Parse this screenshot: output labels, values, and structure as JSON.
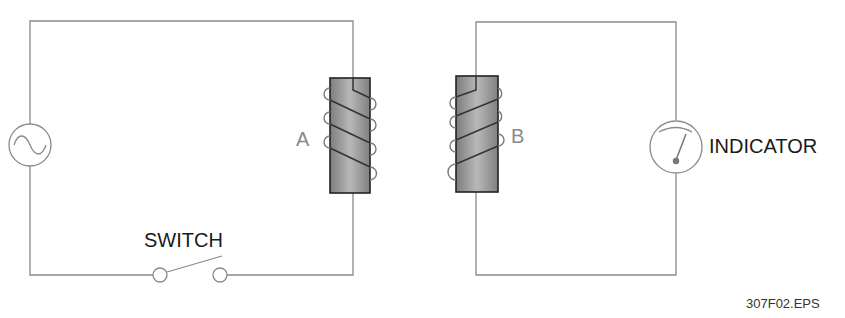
{
  "diagram": {
    "type": "mutual-induction circuit",
    "labels": {
      "coil_a": "A",
      "coil_b": "B",
      "switch": "SWITCH",
      "indicator": "INDICATOR",
      "figure_id": "307F02.EPS"
    },
    "components": [
      {
        "id": "ac-source",
        "kind": "AC source",
        "circuit": "primary"
      },
      {
        "id": "switch",
        "kind": "switch (open)",
        "circuit": "primary"
      },
      {
        "id": "coil-a",
        "kind": "iron-core coil",
        "circuit": "primary"
      },
      {
        "id": "coil-b",
        "kind": "iron-core coil",
        "circuit": "secondary"
      },
      {
        "id": "indicator",
        "kind": "meter",
        "circuit": "secondary"
      }
    ],
    "colors": {
      "wire": "#8a8a8a",
      "core_fill": "#9a9a9a",
      "text": "#1a1a1a"
    }
  }
}
